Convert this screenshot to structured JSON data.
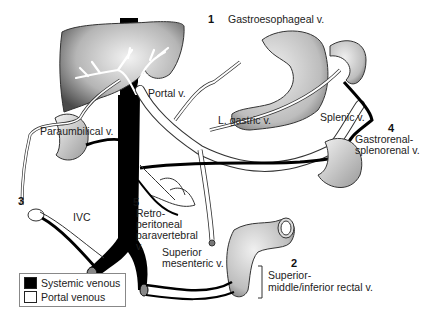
{
  "diagram": {
    "labels": {
      "gastroesophageal": "Gastroesophageal v.",
      "portal": "Portal v.",
      "l_gastric": "L. gastric v.",
      "splenic": "Splenic v.",
      "paraumbilical": "Paraumbilical v.",
      "gastrorenal_1": "Gastrorenal-",
      "gastrorenal_2": "splenorenal v.",
      "ivc": "IVC",
      "retro_1": "Retro-",
      "retro_2": "peritoneal",
      "retro_3": "paravertebral",
      "retro_4": "v.",
      "sup_mes_1": "Superior",
      "sup_mes_2": "mesenteric v.",
      "rectal_1": "Superior-",
      "rectal_2": "middle/inferior rectal v."
    },
    "numbers": {
      "n1": "1",
      "n2": "2",
      "n3": "3",
      "n4": "4",
      "n5": "5"
    },
    "legend": {
      "items": [
        {
          "label": "Systemic venous",
          "color": "#000000"
        },
        {
          "label": "Portal venous",
          "color": "#ffffff"
        }
      ]
    },
    "colors": {
      "systemic": "#000000",
      "portal": "#ffffff",
      "organ_dark": "#555555",
      "organ_light": "#e6e6e6"
    }
  }
}
